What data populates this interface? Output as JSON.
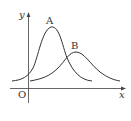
{
  "diagram": {
    "axes": {
      "x_label": "x",
      "y_label": "y",
      "origin_label": "O"
    },
    "curves": [
      {
        "label": "A",
        "description": "taller, narrower bell curve peaking left"
      },
      {
        "label": "B",
        "description": "shorter, wider bell curve peaking right"
      }
    ],
    "colors": {
      "stroke": "#333333",
      "background": "#ffffff"
    }
  }
}
